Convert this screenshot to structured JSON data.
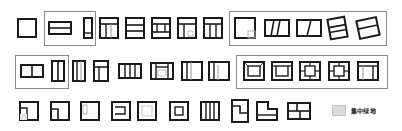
{
  "colors": {
    "stroke": "#1a1a1a",
    "green": "#dcdcdc",
    "frame": "#8a8a8a"
  },
  "rows": [
    {
      "row": 1,
      "icon_count": 12,
      "grouped_boxes": 2
    },
    {
      "row": 2,
      "icon_count": 12,
      "grouped_boxes": 2
    },
    {
      "row": 3,
      "icon_count": 11,
      "grouped_boxes": 0
    }
  ],
  "legend": {
    "swatch_color": "#dcdcdc",
    "label": "集中绿地"
  }
}
